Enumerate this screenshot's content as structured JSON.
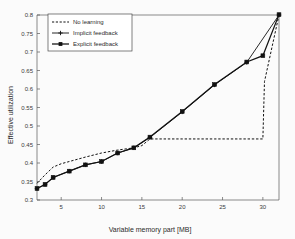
{
  "chart_data": {
    "type": "line",
    "title": "",
    "xlabel": "Variable memory part [MB]",
    "ylabel": "Effective utilization",
    "xlim": [
      2,
      32
    ],
    "ylim": [
      0.3,
      0.8
    ],
    "xticks": [
      5,
      10,
      15,
      20,
      25,
      30
    ],
    "yticks": [
      0.3,
      0.35,
      0.4,
      0.45,
      0.5,
      0.55,
      0.6,
      0.65,
      0.7,
      0.75,
      0.8
    ],
    "xtick_labels": [
      "5",
      "10",
      "15",
      "20",
      "25",
      "30"
    ],
    "ytick_labels": [
      "0.3",
      "0.35",
      "0.4",
      "0.45",
      "0.5",
      "0.55",
      "0.6",
      "0.65",
      "0.7",
      "0.75",
      "0.8"
    ],
    "grid": false,
    "legend_position": "upper left",
    "series": [
      {
        "name": "No learning",
        "style": "dashed",
        "marker": "none",
        "color": "#111111",
        "x": [
          2,
          3,
          4,
          5,
          6,
          8,
          10,
          12,
          14,
          15,
          16,
          20,
          24,
          28,
          30,
          30.2,
          32
        ],
        "y": [
          0.345,
          0.368,
          0.389,
          0.398,
          0.404,
          0.416,
          0.427,
          0.435,
          0.441,
          0.447,
          0.465,
          0.465,
          0.465,
          0.465,
          0.465,
          0.62,
          0.8
        ]
      },
      {
        "name": "Implicit feedback",
        "style": "solid",
        "marker": "plus",
        "color": "#111111",
        "x": [
          2,
          3,
          4,
          6,
          8,
          10,
          12,
          14,
          16,
          20,
          24,
          28,
          32
        ],
        "y": [
          0.331,
          0.342,
          0.361,
          0.378,
          0.395,
          0.404,
          0.427,
          0.441,
          0.469,
          0.538,
          0.611,
          0.672,
          0.8
        ]
      },
      {
        "name": "Explicit feedback",
        "style": "solid",
        "marker": "square",
        "color": "#111111",
        "x": [
          2,
          3,
          4,
          6,
          8,
          10,
          12,
          14,
          16,
          20,
          24,
          28,
          30,
          32
        ],
        "y": [
          0.331,
          0.342,
          0.361,
          0.378,
          0.395,
          0.404,
          0.427,
          0.441,
          0.47,
          0.539,
          0.612,
          0.673,
          0.69,
          0.801
        ]
      }
    ]
  },
  "legend": {
    "items": [
      {
        "label": "No learning"
      },
      {
        "label": "Implicit feedback"
      },
      {
        "label": "Explicit feedback"
      }
    ]
  },
  "axes": {
    "x_title": "Variable memory part [MB]",
    "y_title": "Effective utilization"
  }
}
